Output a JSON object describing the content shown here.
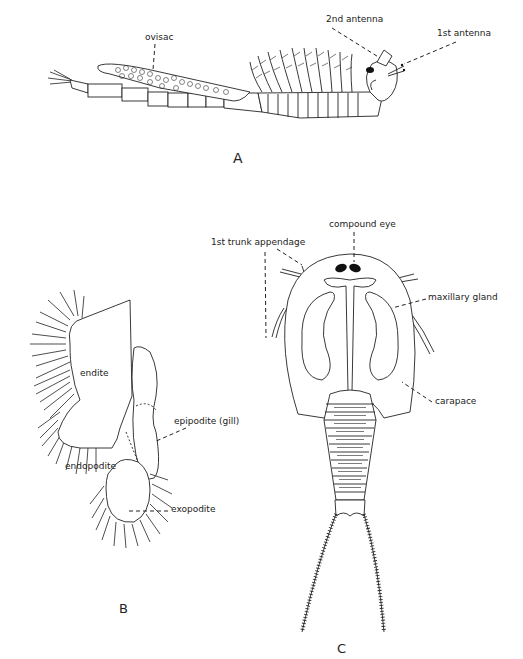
{
  "figures": {
    "A": {
      "label": "A",
      "annotations": {
        "ovisac": "ovisac",
        "second_antenna": "2nd antenna",
        "first_antenna": "1st antenna"
      }
    },
    "B": {
      "label": "B",
      "annotations": {
        "endite": "endite",
        "endopodite": "endopodite",
        "epipodite": "epipodite (gill)",
        "exopodite": "exopodite"
      }
    },
    "C": {
      "label": "C",
      "annotations": {
        "compound_eye": "compound eye",
        "first_trunk_appendage": "1st trunk appendage",
        "maxillary_gland": "maxillary gland",
        "carapace": "carapace"
      }
    }
  }
}
